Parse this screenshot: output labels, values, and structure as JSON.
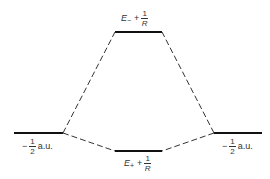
{
  "diagram": {
    "levels": {
      "upper": {
        "symbol": "E",
        "subscript": "−",
        "plus": "+",
        "frac_num": "1",
        "frac_den": "R"
      },
      "lower": {
        "symbol": "E",
        "subscript": "+",
        "plus": "+",
        "frac_num": "1",
        "frac_den": "R"
      },
      "left": {
        "sign": "−",
        "frac_num": "1",
        "frac_den": "2",
        "unit": "a.u."
      },
      "right": {
        "sign": "−",
        "frac_num": "1",
        "frac_den": "2",
        "unit": "a.u."
      }
    },
    "colors": {
      "line": "#111111",
      "dash": "#333333"
    }
  }
}
